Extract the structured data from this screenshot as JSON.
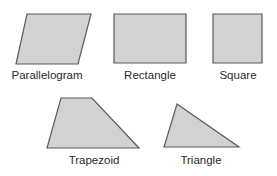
{
  "figure": {
    "title": "",
    "shapes": [
      {
        "id": "parallelogram",
        "label": "Parallelogram",
        "points": "27,14 91,14 78,64 16,64",
        "label_x": 47,
        "label_y": 70
      },
      {
        "id": "rectangle",
        "label": "Rectangle",
        "points": "114,14 186,14 186,63 114,63",
        "label_x": 150,
        "label_y": 70
      },
      {
        "id": "square",
        "label": "Square",
        "points": "213,14 262,14 262,63 213,63",
        "label_x": 238,
        "label_y": 70
      },
      {
        "id": "trapezoid",
        "label": "Trapezoid",
        "points": "61,98 92,98 139,148 47,148",
        "label_x": 94,
        "label_y": 155
      },
      {
        "id": "triangle",
        "label": "Triangle",
        "points": "177,104 239,147 164,147",
        "label_x": 201,
        "label_y": 155
      }
    ],
    "colors": {
      "fill": "#d2d2d2",
      "stroke": "#5a5a5a",
      "text": "#2a2a2a",
      "background": "#ffffff"
    }
  }
}
